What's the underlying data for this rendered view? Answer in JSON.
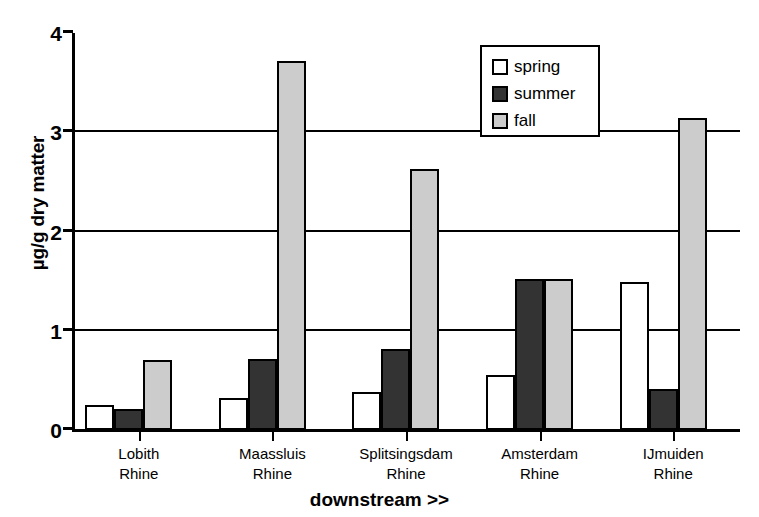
{
  "chart_data": {
    "type": "bar",
    "title": "",
    "xlabel": "downstream >>",
    "ylabel": "µg/g dry matter",
    "ylim": [
      0,
      4
    ],
    "yticks": [
      "0",
      "1",
      "2",
      "3",
      "4"
    ],
    "grid": true,
    "legend_position": "top-right",
    "categories": [
      "Lobith\nRhine",
      "Maassluis\nRhine",
      "Splitsingsdam\nRhine",
      "Amsterdam\nRhine",
      "IJmuiden\nRhine"
    ],
    "category_lines": [
      [
        "Lobith",
        "Rhine"
      ],
      [
        "Maassluis",
        "Rhine"
      ],
      [
        "Splitsingsdam",
        "Rhine"
      ],
      [
        "Amsterdam",
        "Rhine"
      ],
      [
        "IJmuiden",
        "Rhine"
      ]
    ],
    "series": [
      {
        "name": "spring",
        "color": "#ffffff",
        "values": [
          0.25,
          0.32,
          0.38,
          0.55,
          1.49
        ]
      },
      {
        "name": "summer",
        "color": "#333333",
        "values": [
          0.21,
          0.72,
          0.82,
          1.52,
          0.41
        ]
      },
      {
        "name": "fall",
        "color": "#cccccc",
        "values": [
          0.71,
          3.72,
          2.63,
          1.52,
          3.14
        ]
      }
    ]
  },
  "legend": {
    "items": [
      {
        "label": "spring"
      },
      {
        "label": "summer"
      },
      {
        "label": "fall"
      }
    ]
  }
}
